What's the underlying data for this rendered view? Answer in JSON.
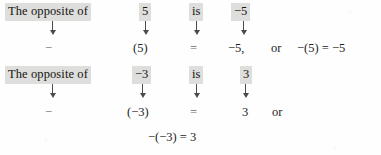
{
  "page": {
    "background_color": "#fefefe",
    "text_color": "#1a1a1a",
    "highlight_color": "#dededd"
  },
  "blocks": [
    {
      "id": "opposite-of-5",
      "prompt_row": {
        "label": "The opposite of",
        "operand": "5",
        "is_word": "is",
        "result": "−5"
      },
      "arrows": [
        "down-arrow",
        "down-arrow",
        "down-arrow",
        "down-arrow"
      ],
      "equation_row": {
        "negation_sign": "−",
        "operand": "(5)",
        "equals": "=",
        "result": "−5,",
        "conjunction": "or",
        "inline_equation": "−(5) = −5"
      }
    },
    {
      "id": "opposite-of-negative-3",
      "prompt_row": {
        "label": "The opposite of",
        "operand": "−3",
        "is_word": "is",
        "result": "3"
      },
      "arrows": [
        "down-arrow",
        "down-arrow",
        "down-arrow",
        "down-arrow"
      ],
      "equation_row": {
        "negation_sign": "−",
        "operand": "(−3)",
        "equals": "=",
        "result": "3",
        "conjunction": "or"
      },
      "centered_equation": "−(−3) = 3"
    }
  ]
}
